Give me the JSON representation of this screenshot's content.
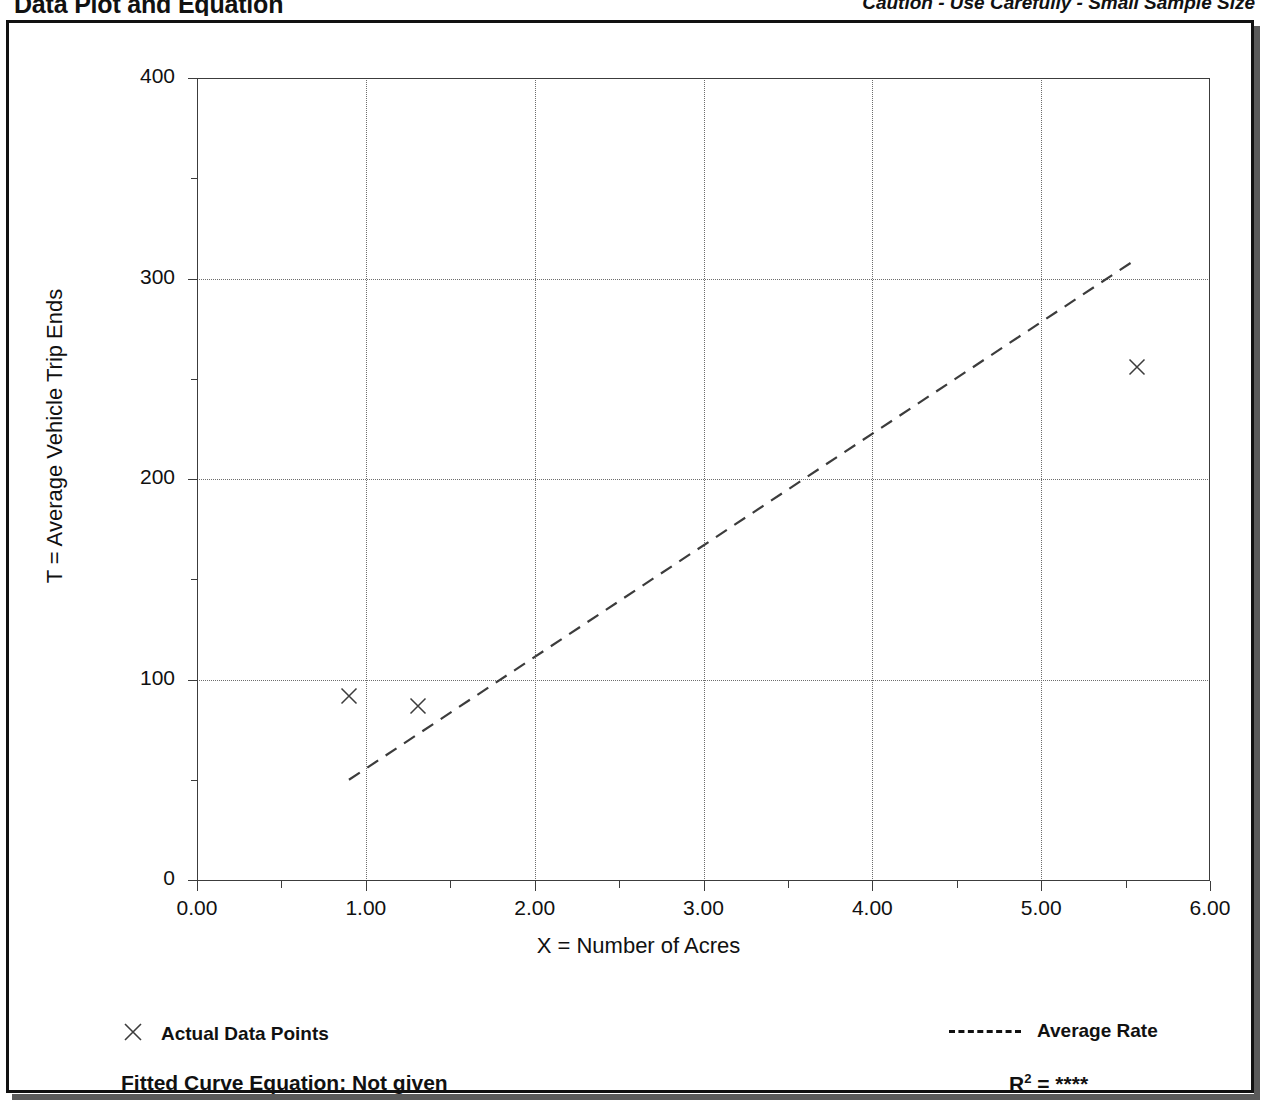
{
  "header": {
    "title": "Data Plot and Equation",
    "caution": "Caution - Use Carefully - Small Sample Size"
  },
  "footer": {
    "equation_label": "Fitted Curve Equation:  Not given",
    "r2_symbol": "R",
    "r2_exponent": "2",
    "r2_value": "= ****"
  },
  "legend": {
    "points_label": "Actual Data Points",
    "rate_label": "Average Rate",
    "marker_icon": "x-marker-icon",
    "line_icon": "dashed-line-icon"
  },
  "chart_data": {
    "type": "scatter",
    "title": "Data Plot and Equation",
    "xlabel": "X = Number of Acres",
    "ylabel": "T = Average Vehicle Trip Ends",
    "xlim": [
      0.0,
      6.0
    ],
    "ylim": [
      0,
      400
    ],
    "xticks": [
      "0.00",
      "1.00",
      "2.00",
      "3.00",
      "4.00",
      "5.00",
      "6.00"
    ],
    "xtick_values": [
      0.0,
      1.0,
      2.0,
      3.0,
      4.0,
      5.0,
      6.0
    ],
    "xminor_values": [
      0.5,
      1.5,
      2.5,
      3.5,
      4.5,
      5.5
    ],
    "yticks": [
      "0",
      "100",
      "200",
      "300",
      "400"
    ],
    "ytick_values": [
      0,
      100,
      200,
      300,
      400
    ],
    "yminor_values": [
      50,
      150,
      250,
      350
    ],
    "grid": true,
    "grid_style": "dotted",
    "legend_position": "below-axes",
    "series": [
      {
        "name": "Actual Data Points",
        "marker": "x",
        "points": [
          {
            "x": 0.9,
            "y": 92
          },
          {
            "x": 1.31,
            "y": 87
          },
          {
            "x": 5.57,
            "y": 256
          }
        ]
      },
      {
        "name": "Average Rate",
        "style": "dashed",
        "line": [
          {
            "x": 0.9,
            "y": 50
          },
          {
            "x": 5.57,
            "y": 310
          }
        ]
      }
    ],
    "fitted_curve_equation": "Not given",
    "r_squared": "****"
  },
  "colors": {
    "background": "#ffffff",
    "frame": "#111111",
    "axis": "#3c3c3c",
    "grid": "#6d6d6d",
    "text": "#111111"
  }
}
